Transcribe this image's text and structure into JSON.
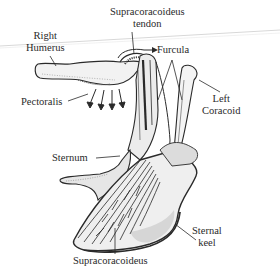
{
  "diagram": {
    "labels": {
      "supracoracoideus_tendon_line1": "Supracoracoideus",
      "supracoracoideus_tendon_line2": "tendon",
      "right_humerus_line1": "Right",
      "right_humerus_line2": "Humerus",
      "furcula": "Furcula",
      "pectoralis": "Pectoralis",
      "left_coracoid_line1": "Left",
      "left_coracoid_line2": "Coracoid",
      "sternum": "Sternum",
      "sternal_keel_line1": "Sternal",
      "sternal_keel_line2": "keel",
      "supracoracoideus": "Supracoracoideus"
    },
    "colors": {
      "ink": "#2a2a2a",
      "background": "#ffffff",
      "stipple": "#9a9a9a",
      "scan_line": "#d8d8d8"
    }
  }
}
